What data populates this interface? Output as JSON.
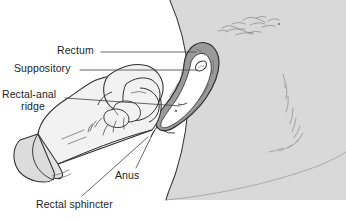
{
  "figure": {
    "kind": "medical-line-illustration",
    "background_color": "#ffffff",
    "skin_fill": "#d9d9d9",
    "glove_fill": "#f2f2f2",
    "rectal_wall_fill": "#9a9a9a",
    "rectal_lumen_fill": "#ffffff",
    "suppository_fill": "#ffffff",
    "ink_color": "#1c1c1c",
    "leader_color": "#4a4a4a"
  },
  "labels": {
    "rectum": "Rectum",
    "suppository": "Suppository",
    "rectal_anal_ridge_line1": "Rectal-anal",
    "rectal_anal_ridge_line2": "ridge",
    "anus": "Anus",
    "rectal_sphincter": "Rectal sphincter"
  },
  "callouts": [
    {
      "name": "rectum",
      "text": "Rectum",
      "leader": "horizontal",
      "target": "upper rectal ampulla"
    },
    {
      "name": "suppository",
      "text": "Suppository",
      "leader": "horizontal",
      "target": "white oval inside rectum"
    },
    {
      "name": "rectal-anal-ridge",
      "text": "Rectal-anal ridge",
      "leader": "horizontal",
      "target": "mid rectal wall ridge"
    },
    {
      "name": "anus",
      "text": "Anus",
      "leader": "diagonal",
      "target": "anal opening"
    },
    {
      "name": "rectal-sphincter",
      "text": "Rectal sphincter",
      "leader": "diagonal",
      "target": "sphincter muscle ring"
    }
  ]
}
